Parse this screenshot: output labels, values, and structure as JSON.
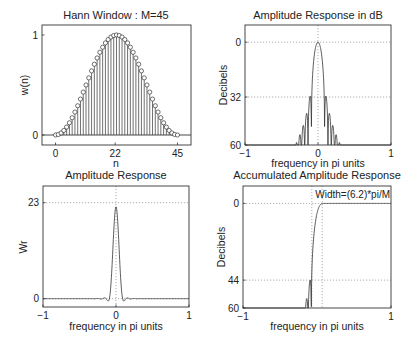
{
  "figure": {
    "width": 404,
    "height": 341,
    "background": "#ffffff",
    "line_color": "#333333",
    "grid_color": "#9a9a9a"
  },
  "chart_data": [
    {
      "id": "hann-window",
      "type": "stem",
      "title": "Hann Window : M=45",
      "xlabel": "n",
      "ylabel": "w(n)",
      "xlim": [
        -5,
        50
      ],
      "ylim": [
        -0.1,
        1.1
      ],
      "xticks": [
        0,
        22,
        45
      ],
      "xticklabels": [
        "0",
        "22",
        "45"
      ],
      "yticks": [
        0,
        1
      ],
      "yticklabels": [
        "0",
        "1"
      ],
      "grid": false,
      "baseline": 0,
      "M": 45,
      "formula": "w(n)=0.5*(1-cos(2*pi*n/(M-1))) for n=0..M-1",
      "n": [
        0,
        1,
        2,
        3,
        4,
        5,
        6,
        7,
        8,
        9,
        10,
        11,
        12,
        13,
        14,
        15,
        16,
        17,
        18,
        19,
        20,
        21,
        22,
        23,
        24,
        25,
        26,
        27,
        28,
        29,
        30,
        31,
        32,
        33,
        34,
        35,
        36,
        37,
        38,
        39,
        40,
        41,
        42,
        43,
        44
      ],
      "values": [
        0.0,
        0.0051,
        0.0203,
        0.0453,
        0.0794,
        0.1221,
        0.1726,
        0.2297,
        0.2923,
        0.3591,
        0.4288,
        0.5,
        0.5712,
        0.6409,
        0.7077,
        0.7703,
        0.8274,
        0.8779,
        0.9206,
        0.9547,
        0.9797,
        0.9949,
        1.0,
        0.9949,
        0.9797,
        0.9547,
        0.9206,
        0.8779,
        0.8274,
        0.7703,
        0.7077,
        0.6409,
        0.5712,
        0.5,
        0.4288,
        0.3591,
        0.2923,
        0.2297,
        0.1726,
        0.1221,
        0.0794,
        0.0453,
        0.0203,
        0.0051,
        0.0
      ],
      "box": {
        "x": 42,
        "y": 25,
        "w": 149,
        "h": 120
      }
    },
    {
      "id": "amp-response-db",
      "type": "line",
      "title": "Amplitude Response in dB",
      "xlabel": "frequency in pi units",
      "ylabel": "Decibels",
      "xlim": [
        -1,
        1
      ],
      "ylim": [
        -60,
        10
      ],
      "y_inverted_labels": true,
      "xticks": [
        -1,
        0,
        1
      ],
      "xticklabels": [
        "−1",
        "0",
        "1"
      ],
      "yticks": [
        0,
        -32,
        -60
      ],
      "yticklabels": [
        "0",
        "32",
        "60"
      ],
      "grid": true,
      "grid_x": [
        0
      ],
      "grid_y": [
        0,
        -32
      ],
      "mainlobe_halfwidth": 0.0909,
      "sidelobe_level_db": -32,
      "box": {
        "x": 245,
        "y": 25,
        "w": 146,
        "h": 120
      }
    },
    {
      "id": "amp-response",
      "type": "line",
      "title": "Amplitude Response",
      "xlabel": "frequency in pi units",
      "ylabel": "Wr",
      "xlim": [
        -1,
        1
      ],
      "ylim": [
        -2,
        27
      ],
      "xticks": [
        -1,
        0,
        1
      ],
      "xticklabels": [
        "−1",
        "0",
        "1"
      ],
      "yticks": [
        0,
        23
      ],
      "yticklabels": [
        "0",
        "23"
      ],
      "grid": true,
      "grid_x": [
        0
      ],
      "grid_y": [
        0,
        23
      ],
      "peak": 22,
      "box": {
        "x": 43,
        "y": 186,
        "w": 146,
        "h": 121
      }
    },
    {
      "id": "accumulated-amp-response",
      "type": "line",
      "title": "Accumulated Amplitude Response",
      "xlabel": "frequency in pi units",
      "ylabel": "Decibels",
      "xlim": [
        -1,
        1
      ],
      "ylim": [
        -60,
        10
      ],
      "xticks": [
        -1,
        1
      ],
      "xticklabels": [
        "−1",
        "1"
      ],
      "yticks": [
        0,
        -44,
        -60
      ],
      "yticklabels": [
        "0",
        "44",
        "60"
      ],
      "grid": true,
      "grid_x": [
        -0.07,
        0.07
      ],
      "grid_y": [
        0,
        -44
      ],
      "annotation": "Width=(6.2)*pi/M",
      "transition_start": -0.07,
      "transition_end": 0.07,
      "stopband_attenuation_db": -44,
      "box": {
        "x": 243,
        "y": 186,
        "w": 148,
        "h": 122
      }
    }
  ]
}
